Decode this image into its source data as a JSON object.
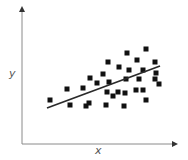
{
  "chart_data": {
    "type": "scatter",
    "title": "",
    "xlabel": "x",
    "ylabel": "y",
    "grid": false,
    "legend": null,
    "trendline": {
      "type": "linear",
      "from_px": [
        47,
        108
      ],
      "to_px": [
        160,
        66
      ]
    },
    "axes_px": {
      "origin": [
        22,
        144
      ],
      "y_top": [
        22,
        8
      ],
      "x_right": [
        176,
        144
      ]
    },
    "points_px": [
      [
        50,
        100
      ],
      [
        67,
        89
      ],
      [
        70,
        105
      ],
      [
        83,
        88
      ],
      [
        86,
        106
      ],
      [
        89,
        103
      ],
      [
        90,
        78
      ],
      [
        97,
        83
      ],
      [
        103,
        74
      ],
      [
        106,
        105
      ],
      [
        107,
        92
      ],
      [
        108,
        62
      ],
      [
        109,
        82
      ],
      [
        113,
        96
      ],
      [
        118,
        92
      ],
      [
        119,
        67
      ],
      [
        124,
        106
      ],
      [
        125,
        93
      ],
      [
        126,
        79
      ],
      [
        127,
        53
      ],
      [
        129,
        70
      ],
      [
        136,
        90
      ],
      [
        137,
        60
      ],
      [
        139,
        79
      ],
      [
        143,
        70
      ],
      [
        143,
        90
      ],
      [
        146,
        49
      ],
      [
        146,
        100
      ],
      [
        155,
        62
      ],
      [
        155,
        79
      ],
      [
        156,
        73
      ],
      [
        159,
        84
      ]
    ],
    "marker": "square",
    "marker_size_px": 5,
    "colors": {
      "points": "#111111",
      "trendline": "#2b2b2b",
      "axes": "#8a8a8a",
      "labels": "#555555"
    }
  },
  "labels": {
    "x": "x",
    "y": "y"
  }
}
